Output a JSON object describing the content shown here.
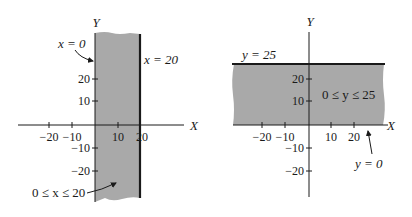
{
  "figure": {
    "colors": {
      "band": "#a9a9a9",
      "ink": "#1a1a1a",
      "background": "#ffffff"
    },
    "left": {
      "x_axis_label": "X",
      "y_axis_label": "Y",
      "x_ticks": [
        "−20",
        "−10",
        "10",
        "20"
      ],
      "y_ticks": [
        "20",
        "10",
        "−10",
        "−20"
      ],
      "boundary_left_label": "x = 0",
      "boundary_right_label": "x = 20",
      "region_label": "0 ≤ x ≤ 20"
    },
    "right": {
      "x_axis_label": "X",
      "y_axis_label": "Y",
      "x_ticks": [
        "−20",
        "−10",
        "10",
        "20"
      ],
      "y_ticks": [
        "20",
        "10",
        "−10",
        "−20"
      ],
      "boundary_top_label": "y = 25",
      "boundary_bottom_label": "y = 0",
      "region_label": "0 ≤ y ≤ 25"
    }
  }
}
